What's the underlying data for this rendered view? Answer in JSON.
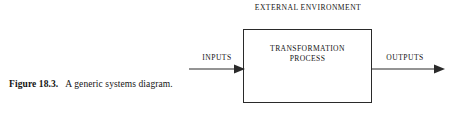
{
  "figure": {
    "caption_label": "Figure 18.3.",
    "caption_text_line1": "A generic systems",
    "caption_text_line2": "diagram."
  },
  "diagram": {
    "environment_title": "EXTERNAL ENVIRONMENT",
    "process_box": {
      "line1": "TRANSFORMATION",
      "line2": "PROCESS"
    },
    "flows": [
      {
        "label": "INPUTS",
        "direction": "right"
      },
      {
        "label": "OUTPUTS",
        "direction": "right"
      }
    ],
    "colors": {
      "stroke": "#2a2a2a",
      "text": "#151515",
      "background": "#ffffff"
    }
  }
}
